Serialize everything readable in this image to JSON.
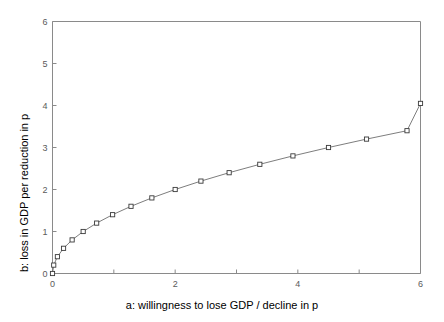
{
  "chart_data": {
    "type": "line",
    "title": "",
    "xlabel": "a: willingness to lose GDP / decline in p",
    "ylabel": "b: loss in GDP per reduction in p",
    "xlim": [
      0,
      6
    ],
    "ylim": [
      0,
      6
    ],
    "grid": false,
    "legend": "none",
    "marker": "open-square",
    "line_color": "#6e6e6e",
    "marker_edge_color": "#3a3a3a",
    "marker_face_color": "#ffffff",
    "axis_color": "#8a8a8a",
    "xticks": [
      0,
      1,
      2,
      3,
      4,
      5,
      6
    ],
    "yticks": [
      0,
      1,
      2,
      3,
      4,
      5,
      6
    ],
    "xticklabels": [
      "0",
      "",
      "2",
      "",
      "4",
      "",
      "6"
    ],
    "yticklabels": [
      "0",
      "1",
      "2",
      "3",
      "4",
      "5",
      "6"
    ],
    "x": [
      0.0,
      0.02,
      0.08,
      0.18,
      0.32,
      0.5,
      0.72,
      0.98,
      1.28,
      1.62,
      2.0,
      2.42,
      2.88,
      3.38,
      3.92,
      4.5,
      5.12,
      5.78,
      6.0
    ],
    "y": [
      0.0,
      0.2,
      0.4,
      0.6,
      0.8,
      1.0,
      1.2,
      1.4,
      1.6,
      1.8,
      2.0,
      2.2,
      2.4,
      2.6,
      2.8,
      3.0,
      3.2,
      3.4,
      4.05
    ],
    "series": [
      {
        "name": "b vs a",
        "points": [
          [
            0.0,
            0.0
          ],
          [
            0.02,
            0.2
          ],
          [
            0.08,
            0.4
          ],
          [
            0.18,
            0.6
          ],
          [
            0.32,
            0.8
          ],
          [
            0.5,
            1.0
          ],
          [
            0.72,
            1.2
          ],
          [
            0.98,
            1.4
          ],
          [
            1.28,
            1.6
          ],
          [
            1.62,
            1.8
          ],
          [
            2.0,
            2.0
          ],
          [
            2.42,
            2.2
          ],
          [
            2.88,
            2.4
          ],
          [
            3.38,
            2.6
          ],
          [
            3.92,
            2.8
          ],
          [
            4.5,
            3.0
          ],
          [
            5.12,
            3.2
          ],
          [
            5.78,
            3.4
          ],
          [
            6.0,
            4.05
          ]
        ]
      }
    ]
  }
}
